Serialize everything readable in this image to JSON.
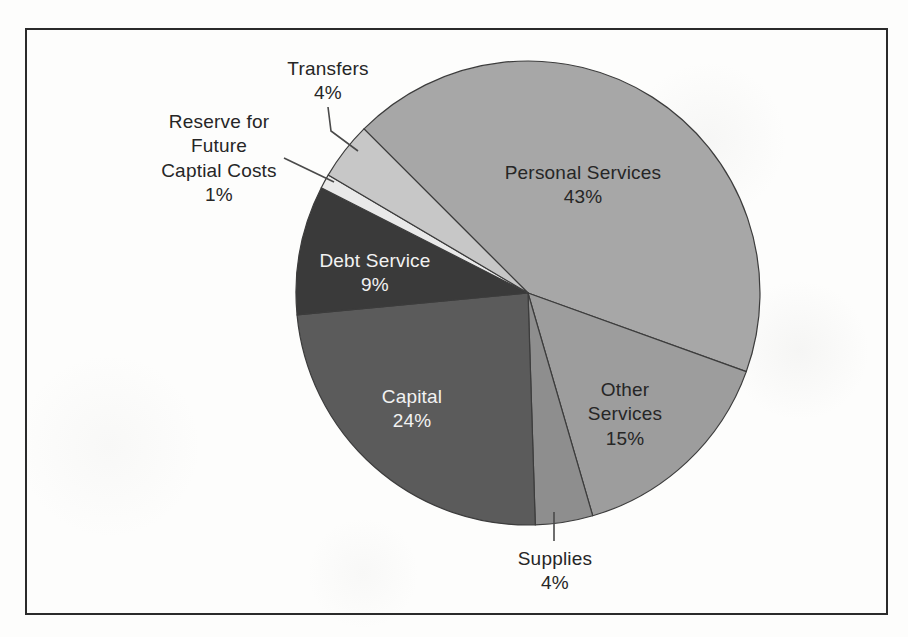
{
  "figure": {
    "kind": "scanned report figure",
    "background_color": "#fdfdfc",
    "border_color": "#2b2b2b"
  },
  "chart_data": {
    "type": "pie",
    "title": "",
    "legend": "none",
    "direction": "clockwise",
    "start_angle_deg": -45,
    "outline_color": "#3c3c3c",
    "leader_color": "#4a4a4a",
    "font_size": 19,
    "line_height": 24.5,
    "geometry": {
      "cx": 528,
      "cy": 293,
      "r": 232
    },
    "categories": [
      "Personal Services",
      "Other Services",
      "Supplies",
      "Capital",
      "Debt Service",
      "Reserve for Future Captial Costs",
      "Transfers"
    ],
    "values": [
      43,
      15,
      4,
      24,
      9,
      1,
      4
    ],
    "slices": [
      {
        "label": "Personal Services",
        "pct": 43,
        "pct_label": "43%",
        "color": "#a7a7a7",
        "text_color": "#262626",
        "label_lines": [
          "Personal Services",
          "43%"
        ],
        "label_placement": "inside",
        "label_x": 583,
        "label_y": 172,
        "leader": null
      },
      {
        "label": "Other Services",
        "pct": 15,
        "pct_label": "15%",
        "color": "#9d9d9d",
        "text_color": "#262626",
        "label_lines": [
          "Other",
          "Services",
          "15%"
        ],
        "label_placement": "inside",
        "label_x": 625,
        "label_y": 389,
        "leader": null
      },
      {
        "label": "Supplies",
        "pct": 4,
        "pct_label": "4%",
        "color": "#8e8e8e",
        "text_color": "#262626",
        "label_lines": [
          "Supplies",
          "4%"
        ],
        "label_placement": "outside",
        "label_x": 555,
        "label_y": 558,
        "leader": [
          [
            554,
            541
          ],
          [
            554,
            512
          ]
        ]
      },
      {
        "label": "Capital",
        "pct": 24,
        "pct_label": "24%",
        "color": "#5b5b5b",
        "text_color": "#f2f2f2",
        "label_lines": [
          "Capital",
          "24%"
        ],
        "label_placement": "inside",
        "label_x": 412,
        "label_y": 396,
        "leader": null
      },
      {
        "label": "Debt Service",
        "pct": 9,
        "pct_label": "9%",
        "color": "#3a3a3a",
        "text_color": "#f2f2f2",
        "label_lines": [
          "Debt Service",
          "9%"
        ],
        "label_placement": "inside",
        "label_x": 375,
        "label_y": 260,
        "leader": null
      },
      {
        "label": "Reserve for Future Captial Costs",
        "pct": 1,
        "pct_label": "1%",
        "color": "#e9e9e9",
        "text_color": "#262626",
        "label_lines": [
          "Reserve for",
          "Future",
          "Captial Costs",
          "1%"
        ],
        "label_placement": "outside",
        "label_x": 219,
        "label_y": 121,
        "leader": [
          [
            284,
            158
          ],
          [
            334,
            182
          ]
        ]
      },
      {
        "label": "Transfers",
        "pct": 4,
        "pct_label": "4%",
        "color": "#c7c7c7",
        "text_color": "#262626",
        "label_lines": [
          "Transfers",
          "4%"
        ],
        "label_placement": "outside",
        "label_x": 328,
        "label_y": 68,
        "leader": [
          [
            328,
            107
          ],
          [
            331,
            131
          ],
          [
            358,
            151
          ]
        ]
      }
    ]
  }
}
